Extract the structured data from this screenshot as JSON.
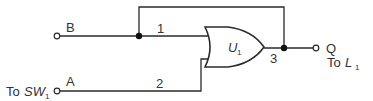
{
  "diagram": {
    "type": "logic-circuit",
    "gate": {
      "kind": "OR",
      "name": "U",
      "name_sub": "1"
    },
    "inputs": [
      {
        "id": "B",
        "label": "B",
        "pin": "1",
        "source_label": ""
      },
      {
        "id": "A",
        "label": "A",
        "pin": "2",
        "source_prefix": "To ",
        "source_name": "SW",
        "source_sub": "1"
      }
    ],
    "output": {
      "id": "Q",
      "label": "Q",
      "pin": "3",
      "dest_prefix": "To ",
      "dest_name": "L",
      "dest_sub": "1"
    },
    "feedback": {
      "from": "output pin 3",
      "to": "input B / pin 1 node",
      "description": "Output Q is fed back to input pin 1 (latching OR)"
    },
    "colors": {
      "line": "#2a2a2a",
      "text": "#333333",
      "background": "#ffffff"
    }
  }
}
